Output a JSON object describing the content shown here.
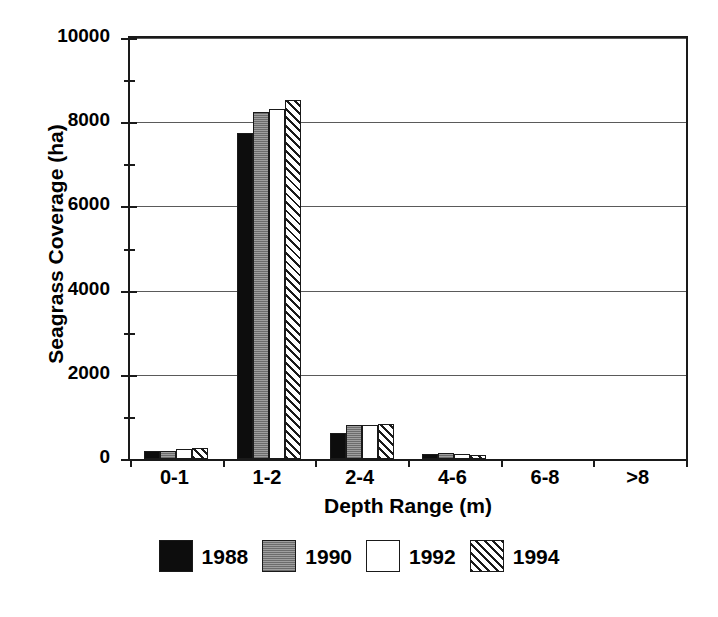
{
  "chart_data": {
    "type": "bar",
    "title": "",
    "xlabel": "Depth Range (m)",
    "ylabel": "Seagrass Coverage (ha)",
    "categories": [
      "0-1",
      "1-2",
      "2-4",
      "4-6",
      "6-8",
      ">8"
    ],
    "series": [
      {
        "name": "1988",
        "pattern": "solid-black",
        "values": [
          200,
          7750,
          620,
          110,
          0,
          0
        ]
      },
      {
        "name": "1990",
        "pattern": "gray-fill",
        "values": [
          200,
          8250,
          800,
          140,
          0,
          0
        ]
      },
      {
        "name": "1992",
        "pattern": "white-fill",
        "values": [
          230,
          8320,
          810,
          130,
          0,
          0
        ]
      },
      {
        "name": "1994",
        "pattern": "diagonal-hatch",
        "values": [
          250,
          8520,
          830,
          100,
          0,
          0
        ]
      }
    ],
    "ylim": [
      0,
      10000
    ],
    "yticks": [
      0,
      2000,
      4000,
      6000,
      8000,
      10000
    ],
    "ytick_labels": [
      "0",
      "2000",
      "4000",
      "6000",
      "8000",
      "10000"
    ],
    "yminor_ticks": [
      1000,
      3000,
      5000,
      7000,
      9000
    ],
    "grid": "horizontal",
    "legend_position": "bottom-center"
  },
  "legend": {
    "entries": [
      {
        "label": "1988"
      },
      {
        "label": "1990"
      },
      {
        "label": "1992"
      },
      {
        "label": "1994"
      }
    ]
  },
  "colors": {
    "axis": "#1a1a1a",
    "gridline": "#5a5a5a",
    "series_1988": "#0d0d0d",
    "series_1990": "#8a8a8a",
    "series_1992": "#ffffff",
    "series_1994": "#ffffff",
    "background": "#ffffff"
  }
}
